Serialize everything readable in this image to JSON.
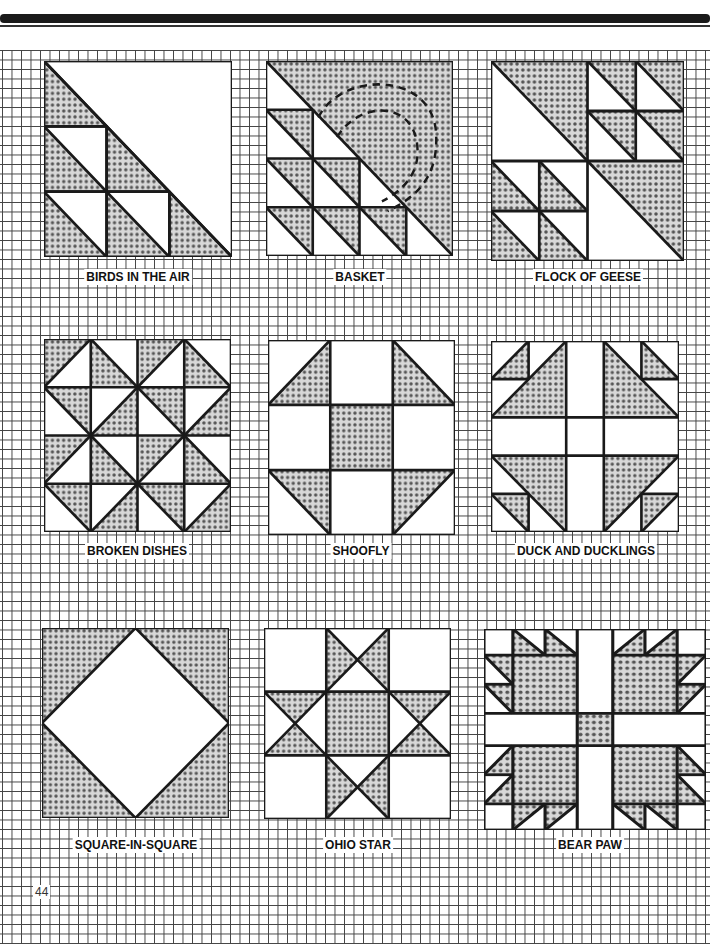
{
  "page": {
    "page_number": "44"
  },
  "colors": {
    "ink": "#1a1a1a",
    "shade": "#b9b9b9",
    "paper": "#ffffff"
  },
  "blocks": [
    {
      "name": "BIRDS IN THE AIR"
    },
    {
      "name": "BASKET"
    },
    {
      "name": "FLOCK OF GEESE"
    },
    {
      "name": "BROKEN DISHES"
    },
    {
      "name": "SHOOFLY"
    },
    {
      "name": "DUCK AND DUCKLINGS"
    },
    {
      "name": "SQUARE-IN-SQUARE"
    },
    {
      "name": "OHIO STAR"
    },
    {
      "name": "BEAR PAW"
    }
  ]
}
